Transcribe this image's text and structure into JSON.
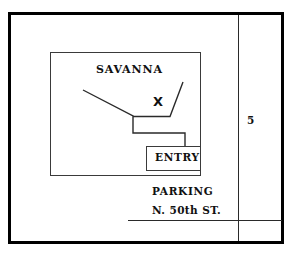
{
  "figure": {
    "name": "savanna-site-map",
    "background_color": "#ffffff",
    "line_color": "#1a1a1a",
    "border_color": "#000000"
  },
  "labels": {
    "building_name": "SAVANNA",
    "entry": "ENTRY",
    "parking": "PARKING",
    "street": "N. 50th ST.",
    "corridor_number": "5",
    "location_marker": "X"
  },
  "geometry": {
    "outer_border": {
      "x": 8,
      "y": 12,
      "width": 276,
      "height": 232,
      "stroke_width": 3
    },
    "building_outline": {
      "x": 50,
      "y": 52,
      "width": 150,
      "height": 123,
      "stroke_width": 1
    },
    "entry_box": {
      "x": 146,
      "y": 146,
      "width": 54,
      "height": 24,
      "stroke_width": 1
    },
    "corridor_line": {
      "x": 238,
      "y_start": 13,
      "y_end": 243
    },
    "street_line": {
      "x_start": 128,
      "x_end": 282,
      "y": 220
    },
    "interior_path": "M 83 90 L 133 116 L 133 133 L 185 133 L 185 146",
    "right_path": "M 183 82 L 170 116 L 133 116"
  }
}
